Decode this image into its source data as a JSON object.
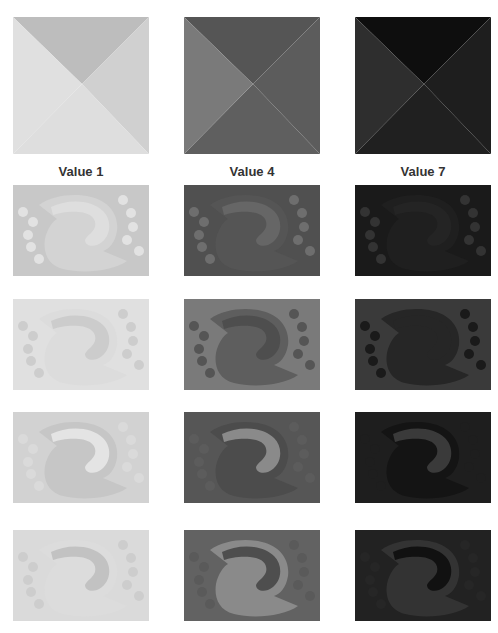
{
  "figure": {
    "columns": [
      {
        "label": "Value 1",
        "x": 13
      },
      {
        "label": "Value 4",
        "x": 184
      },
      {
        "label": "Value 7",
        "x": 355
      }
    ],
    "pyramids": [
      {
        "top": "#bdbdbd",
        "right": "#d0d0d0",
        "bottom": "#dedede",
        "left": "#e0e0e0"
      },
      {
        "top": "#555555",
        "right": "#5c5c5c",
        "bottom": "#5f5f5f",
        "left": "#7a7a7a"
      },
      {
        "top": "#0e0e0e",
        "right": "#1e1e1e",
        "bottom": "#202020",
        "left": "#2e2e2e"
      }
    ],
    "rows": [
      {
        "y": 185,
        "panels": [
          {
            "bg": "#c8c8c8",
            "blob": "#d3d3d3",
            "arc": "#dedede",
            "dots": "#e2e2e2"
          },
          {
            "bg": "#505050",
            "blob": "#555555",
            "arc": "#666666",
            "dots": "#6e6e6e"
          },
          {
            "bg": "#1a1a1a",
            "blob": "#1f1f1f",
            "arc": "#242424",
            "dots": "#333333"
          }
        ]
      },
      {
        "y": 299,
        "panels": [
          {
            "bg": "#e0e0e0",
            "blob": "#dcdcdc",
            "arc": "#cccccc",
            "dots": "#cdcdcd"
          },
          {
            "bg": "#7a7a7a",
            "blob": "#5e5e5e",
            "arc": "#4e4e4e",
            "dots": "#555555"
          },
          {
            "bg": "#3a3a3a",
            "blob": "#262626",
            "arc": "#262626",
            "dots": "#1a1a1a"
          }
        ]
      },
      {
        "y": 412,
        "panels": [
          {
            "bg": "#d2d2d2",
            "blob": "#c6c6c6",
            "arc": "#e4e4e4",
            "dots": "#dadada"
          },
          {
            "bg": "#565656",
            "blob": "#4c4c4c",
            "arc": "#8a8a8a",
            "dots": "#5c5c5c"
          },
          {
            "bg": "#1e1e1e",
            "blob": "#141414",
            "arc": "#3a3a3a",
            "dots": "#1e1e1e"
          }
        ]
      },
      {
        "y": 530,
        "panels": [
          {
            "bg": "#dadada",
            "blob": "#dcdcdc",
            "arc": "#c2c2c2",
            "dots": "#cdcdcd"
          },
          {
            "bg": "#626262",
            "blob": "#8a8a8a",
            "arc": "#4e4e4e",
            "dots": "#5a5a5a"
          },
          {
            "bg": "#222222",
            "blob": "#333333",
            "arc": "#111111",
            "dots": "#262626"
          }
        ]
      }
    ]
  }
}
